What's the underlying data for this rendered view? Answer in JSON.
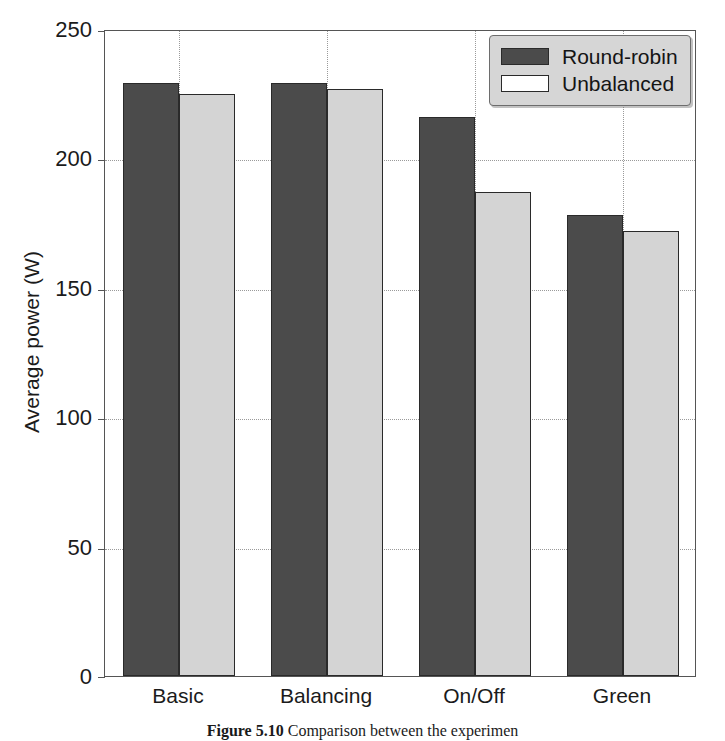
{
  "chart_data": {
    "type": "bar",
    "title": "",
    "xlabel": "",
    "ylabel": "Average power (W)",
    "categories": [
      "Basic",
      "Balancing",
      "On/Off",
      "Green"
    ],
    "series": [
      {
        "name": "Round-robin",
        "color": "#4b4b4b",
        "values": [
          229,
          229,
          216,
          178
        ]
      },
      {
        "name": "Unbalanced",
        "color": "#d4d4d4",
        "values": [
          225,
          227,
          187,
          172
        ]
      }
    ],
    "ylim": [
      0,
      250
    ],
    "yticks": [
      0,
      50,
      100,
      150,
      200,
      250
    ],
    "ytick_labels": [
      "0",
      "50",
      "100",
      "150",
      "200",
      "250"
    ],
    "grid": "horizontal-and-vertical-dotted",
    "legend_position": "top-right"
  },
  "legend": {
    "entries": [
      {
        "label": "Round-robin",
        "swatch": "dark-gray-filled-swatch"
      },
      {
        "label": "Unbalanced",
        "swatch": "white-filled-swatch"
      }
    ]
  },
  "caption": {
    "label": "Figure 5.10",
    "text": "Comparison between the experimen"
  }
}
